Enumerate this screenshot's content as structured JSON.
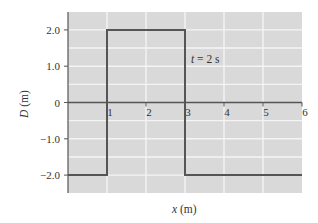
{
  "chart_data": {
    "type": "line",
    "title": "",
    "annotation": "t = 2 s",
    "xlabel": "x (m)",
    "ylabel": "D (m)",
    "xlim": [
      0,
      6
    ],
    "ylim": [
      -2.5,
      2.5
    ],
    "x_ticks": [
      "1",
      "2",
      "3",
      "4",
      "5",
      "6"
    ],
    "y_ticks": [
      "2.0",
      "1.0",
      "0",
      "−1.0",
      "−2.0"
    ],
    "y_tick_values": [
      2,
      1,
      0,
      -1,
      -2
    ],
    "x_tick_values": [
      1,
      2,
      3,
      4,
      5,
      6
    ],
    "grid": true,
    "series": [
      {
        "name": "D(x) at t = 2 s",
        "x": [
          0,
          1,
          1,
          3,
          3,
          6
        ],
        "y": [
          -2,
          -2,
          2,
          2,
          -2,
          -2
        ]
      }
    ],
    "colors": {
      "background": "#d9d9d9",
      "grid": "#f4f4f4",
      "line": "#555555",
      "axis": "#555555"
    }
  },
  "labels": {
    "annotation": "t = 2 s",
    "xlabel_var": "x",
    "xlabel_unit": " (m)",
    "ylabel_var": "D",
    "ylabel_unit": " (m)"
  }
}
